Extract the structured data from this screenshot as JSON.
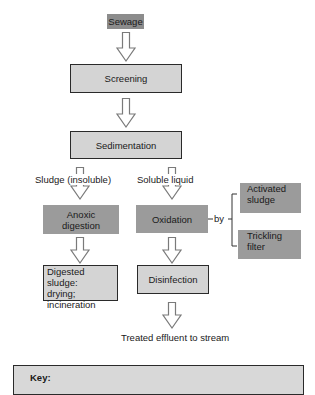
{
  "diagram": {
    "source": {
      "label": "Sewage"
    },
    "steps": {
      "screening": {
        "label": "Screening"
      },
      "sedimentation": {
        "label": "Sedimentation"
      },
      "anoxic_digestion": {
        "label_line1": "Anoxic",
        "label_line2": "digestion"
      },
      "oxidation": {
        "label": "Oxidation"
      },
      "digested_sludge": {
        "label_line1": "Digested sludge:",
        "label_line2": "drying;",
        "label_line3": "incineration"
      },
      "disinfection": {
        "label": "Disinfection"
      },
      "activated_sludge": {
        "label_line1": "Activated",
        "label_line2": "sludge"
      },
      "trickling_filter": {
        "label_line1": "Trickling",
        "label_line2": "filter"
      }
    },
    "branch_labels": {
      "sludge": "Sludge (insoluble)",
      "liquid": "Soluble liquid",
      "by": "by"
    },
    "output": {
      "label": "Treated effluent to stream"
    },
    "key": {
      "title": "Key:"
    },
    "colors": {
      "process_box_fill": "#d4d4d4",
      "biological_box_fill": "#9b9b9b",
      "source_box_fill": "#8c8c8c",
      "border": "#2a2a2a",
      "arrow_outline": "#7a7a7a"
    }
  }
}
